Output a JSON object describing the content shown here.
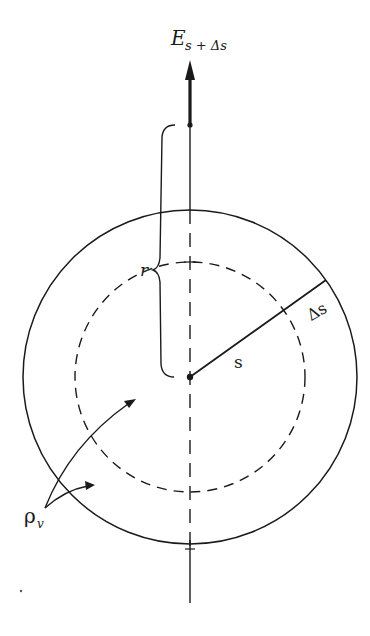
{
  "figure": {
    "labels": {
      "field": "E",
      "field_subscript": "s + Δs",
      "radius_r": "r",
      "radius_s": "s",
      "delta_s": "Δs",
      "charge_density": "ρ",
      "charge_density_subscript": "v"
    },
    "geometry": {
      "center": [
        190,
        377
      ],
      "outer_radius": 167,
      "inner_dashed_radius": 115,
      "axis_x": 190,
      "axis_top": 8,
      "axis_bottom": 603,
      "field_point": [
        190,
        125
      ],
      "radius_endpoint": [
        326,
        280
      ]
    },
    "colors": {
      "line": "#1a1a1a",
      "background": "#ffffff"
    }
  }
}
